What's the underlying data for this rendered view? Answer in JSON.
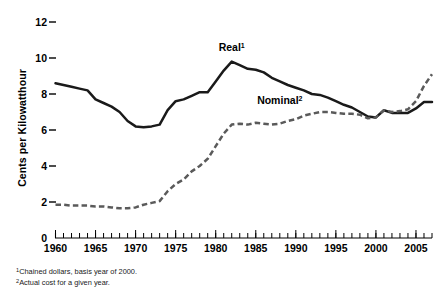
{
  "chart_data": {
    "type": "line",
    "title": "",
    "xlabel": "",
    "ylabel": "Cents per Kilowatthour",
    "xlim": [
      1960,
      2007
    ],
    "ylim": [
      0,
      12
    ],
    "yticks": [
      0,
      2,
      4,
      6,
      8,
      10,
      12
    ],
    "ytick_labels": [
      "0",
      "2",
      "4",
      "6",
      "8",
      "10",
      "12"
    ],
    "xticks": [
      1960,
      1965,
      1970,
      1975,
      1980,
      1985,
      1990,
      1995,
      2000,
      2005
    ],
    "xtick_labels": [
      "1960",
      "1965",
      "1970",
      "1975",
      "1980",
      "1985",
      "1990",
      "1995",
      "2000",
      "2005"
    ],
    "minor_xtick_interval": 1,
    "grid": false,
    "legend_position": "inline-annotations",
    "x": [
      1960,
      1961,
      1962,
      1963,
      1964,
      1965,
      1966,
      1967,
      1968,
      1969,
      1970,
      1971,
      1972,
      1973,
      1974,
      1975,
      1976,
      1977,
      1978,
      1979,
      1980,
      1981,
      1982,
      1983,
      1984,
      1985,
      1986,
      1987,
      1988,
      1989,
      1990,
      1991,
      1992,
      1993,
      1994,
      1995,
      1996,
      1997,
      1998,
      1999,
      2000,
      2001,
      2002,
      2003,
      2004,
      2005,
      2006,
      2007
    ],
    "series": [
      {
        "name": "Real",
        "footnote_marker": "1",
        "style": "solid",
        "color": "#1a1a1a",
        "label_text": "Real",
        "values": [
          8.6,
          8.5,
          8.4,
          8.3,
          8.2,
          7.7,
          7.5,
          7.3,
          7.0,
          6.5,
          6.2,
          6.15,
          6.2,
          6.3,
          7.1,
          7.6,
          7.7,
          7.9,
          8.1,
          8.1,
          8.7,
          9.3,
          9.8,
          9.6,
          9.4,
          9.35,
          9.2,
          8.9,
          8.7,
          8.5,
          8.35,
          8.2,
          8.0,
          7.95,
          7.8,
          7.6,
          7.4,
          7.25,
          7.0,
          6.75,
          6.7,
          7.1,
          6.95,
          6.95,
          6.95,
          7.2,
          7.55,
          7.55
        ]
      },
      {
        "name": "Nominal",
        "footnote_marker": "2",
        "style": "dashed",
        "color": "#5a5a5a",
        "label_text": "Nominal",
        "values": [
          1.85,
          1.85,
          1.8,
          1.8,
          1.8,
          1.75,
          1.75,
          1.7,
          1.65,
          1.65,
          1.7,
          1.85,
          1.95,
          2.05,
          2.6,
          3.0,
          3.25,
          3.7,
          4.0,
          4.4,
          5.1,
          5.8,
          6.3,
          6.35,
          6.3,
          6.4,
          6.35,
          6.3,
          6.35,
          6.5,
          6.6,
          6.8,
          6.9,
          7.0,
          7.0,
          6.95,
          6.9,
          6.9,
          6.85,
          6.65,
          6.7,
          7.1,
          7.0,
          7.05,
          7.15,
          7.6,
          8.45,
          9.1
        ]
      }
    ],
    "annotations": [
      {
        "name": "real-series-label",
        "text": "Real",
        "footnote_marker": "1",
        "x": 1982,
        "y": 10.4
      },
      {
        "name": "nominal-series-label",
        "text": "Nominal",
        "footnote_marker": "2",
        "x": 1988,
        "y": 7.45
      }
    ],
    "footnotes": [
      {
        "marker": "1",
        "text": "Chained dollars, basis year of 2000."
      },
      {
        "marker": "2",
        "text": "Actual cost for a given year."
      }
    ]
  }
}
